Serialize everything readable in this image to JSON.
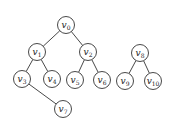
{
  "diagram": {
    "type": "forest",
    "colors": {
      "stroke": "#333333",
      "fill": "#ffffff",
      "text": "#222222"
    },
    "node_radius": 8.5,
    "nodes": [
      {
        "id": "v0",
        "base": "v",
        "sub": "0",
        "x": 66,
        "y": 25
      },
      {
        "id": "v1",
        "base": "v",
        "sub": "1",
        "x": 37,
        "y": 52
      },
      {
        "id": "v2",
        "base": "v",
        "sub": "2",
        "x": 88,
        "y": 52
      },
      {
        "id": "v3",
        "base": "v",
        "sub": "3",
        "x": 22,
        "y": 79
      },
      {
        "id": "v4",
        "base": "v",
        "sub": "4",
        "x": 52,
        "y": 79
      },
      {
        "id": "v5",
        "base": "v",
        "sub": "5",
        "x": 75,
        "y": 80
      },
      {
        "id": "v6",
        "base": "v",
        "sub": "6",
        "x": 102,
        "y": 80
      },
      {
        "id": "v7",
        "base": "v",
        "sub": "7",
        "x": 63,
        "y": 109
      },
      {
        "id": "v8",
        "base": "v",
        "sub": "8",
        "x": 140,
        "y": 53
      },
      {
        "id": "v9",
        "base": "v",
        "sub": "9",
        "x": 125,
        "y": 81
      },
      {
        "id": "v10",
        "base": "v",
        "sub": "10",
        "x": 153,
        "y": 81
      }
    ],
    "edges": [
      {
        "from": "v0",
        "to": "v1"
      },
      {
        "from": "v0",
        "to": "v2"
      },
      {
        "from": "v1",
        "to": "v3"
      },
      {
        "from": "v1",
        "to": "v4"
      },
      {
        "from": "v2",
        "to": "v5"
      },
      {
        "from": "v2",
        "to": "v6"
      },
      {
        "from": "v3",
        "to": "v7"
      },
      {
        "from": "v8",
        "to": "v9"
      },
      {
        "from": "v8",
        "to": "v10"
      }
    ]
  }
}
